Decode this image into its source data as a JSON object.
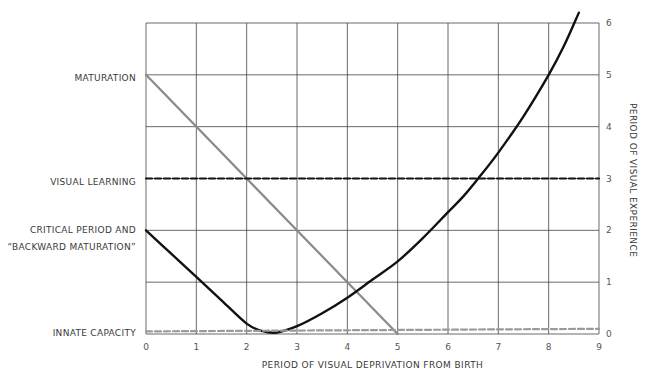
{
  "chart_data": {
    "type": "line",
    "title": "",
    "xlabel": "PERIOD OF VISUAL DEPRIVATION FROM BIRTH",
    "ylabel": "PERIOD OF VISUAL EXPERIENCE",
    "x_ticks": [
      "0",
      "1",
      "2",
      "3",
      "4",
      "5",
      "6",
      "7",
      "8",
      "9"
    ],
    "y_ticks": [
      "0",
      "1",
      "2",
      "3",
      "4",
      "5",
      "6"
    ],
    "xlim": [
      0,
      9
    ],
    "ylim": [
      0,
      6
    ],
    "grid": true,
    "y_axis_position": "right",
    "legend": "none (series labeled on left margin)",
    "series": [
      {
        "name": "MATURATION",
        "style": "solid gray",
        "color": "#808080",
        "x": [
          0,
          5
        ],
        "y": [
          5,
          0
        ]
      },
      {
        "name": "VISUAL LEARNING",
        "style": "dashed black",
        "color": "#111111",
        "x": [
          0,
          9
        ],
        "y": [
          3,
          3
        ]
      },
      {
        "name": "CRITICAL PERIOD AND \"BACKWARD MATURATION\"",
        "style": "solid black",
        "color": "#111111",
        "x": [
          0,
          0.5,
          1,
          1.5,
          2,
          2.3,
          2.6,
          3,
          3.5,
          4,
          4.5,
          5,
          5.5,
          6,
          6.3,
          6.6,
          7,
          7.5,
          8,
          8.3,
          8.6
        ],
        "y": [
          2,
          1.55,
          1.1,
          0.65,
          0.2,
          0.06,
          0.03,
          0.15,
          0.4,
          0.7,
          1.05,
          1.4,
          1.85,
          2.35,
          2.65,
          3.0,
          3.5,
          4.2,
          5.0,
          5.55,
          6.2
        ]
      },
      {
        "name": "INNATE CAPACITY",
        "style": "dashed gray",
        "color": "#909090",
        "x": [
          0,
          9
        ],
        "y": [
          0.05,
          0.1
        ]
      }
    ],
    "annotations": [
      {
        "text": "MATURATION",
        "y": 5
      },
      {
        "text": "VISUAL LEARNING",
        "y": 3
      },
      {
        "text": "CRITICAL PERIOD AND",
        "y": 2
      },
      {
        "text": "\"BACKWARD MATURATION\"",
        "y": 2
      },
      {
        "text": "INNATE CAPACITY",
        "y": 0.05
      }
    ]
  },
  "labels": {
    "maturation": "MATURATION",
    "visual_learning": "VISUAL LEARNING",
    "critical_period_line1": "CRITICAL PERIOD AND",
    "critical_period_line2": "“BACKWARD MATURATION”",
    "innate_capacity": "INNATE CAPACITY",
    "xlabel": "PERIOD OF VISUAL DEPRIVATION FROM BIRTH",
    "ylabel": "PERIOD OF VISUAL EXPERIENCE"
  },
  "x_ticks": [
    "0",
    "1",
    "2",
    "3",
    "4",
    "5",
    "6",
    "7",
    "8",
    "9"
  ],
  "y_ticks": [
    "0",
    "1",
    "2",
    "3",
    "4",
    "5",
    "6"
  ]
}
